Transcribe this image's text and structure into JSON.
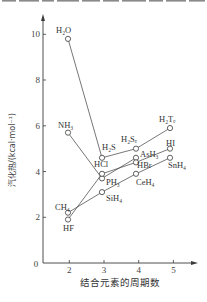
{
  "chart_data": {
    "type": "line",
    "title": "",
    "xlabel": "结合元素的周期数",
    "ylabel": "汽化热/(kcal·mol⁻¹)",
    "origin_label": "0",
    "x_ticks": [
      2,
      3,
      4,
      5
    ],
    "x_tick_labels": [
      "2",
      "3",
      "4",
      "5"
    ],
    "y_ticks": [
      2,
      4,
      6,
      8,
      10
    ],
    "y_tick_labels": [
      "2",
      "4",
      "6",
      "8",
      "10"
    ],
    "xlim": [
      1.2,
      5.6
    ],
    "ylim": [
      0,
      10.7
    ],
    "grid": false,
    "legend": null,
    "marker": "open-circle",
    "series": [
      {
        "points": [
          {
            "label": "CH₄",
            "x": 2,
            "y": 2.2
          },
          {
            "label": "SiH₄",
            "x": 3,
            "y": 3.1
          },
          {
            "label": "CeH₄",
            "x": 4,
            "y": 3.9
          },
          {
            "label": "SnH₄",
            "x": 5,
            "y": 4.6
          }
        ]
      },
      {
        "points": [
          {
            "label": "NH₃",
            "x": 2,
            "y": 5.7
          },
          {
            "label": "PH₃",
            "x": 3,
            "y": 3.7
          },
          {
            "label": "AsH₃",
            "x": 4,
            "y": 4.6
          }
        ]
      },
      {
        "points": [
          {
            "label": "H₂O",
            "x": 2,
            "y": 9.8
          },
          {
            "label": "H₂S",
            "x": 3,
            "y": 4.6
          },
          {
            "label": "H₂Sₑ",
            "x": 4,
            "y": 5.0
          },
          {
            "label": "H₂Tₑ",
            "x": 5,
            "y": 5.9
          }
        ]
      },
      {
        "points": [
          {
            "label": "HF",
            "x": 2,
            "y": 1.9
          },
          {
            "label": "HCl",
            "x": 3,
            "y": 3.9
          },
          {
            "label": "HBr",
            "x": 4,
            "y": 4.4
          },
          {
            "label": "HI",
            "x": 5,
            "y": 5.0
          }
        ]
      }
    ]
  },
  "colors": {
    "background": "#ffffff",
    "ink": "#3a3a3a"
  }
}
